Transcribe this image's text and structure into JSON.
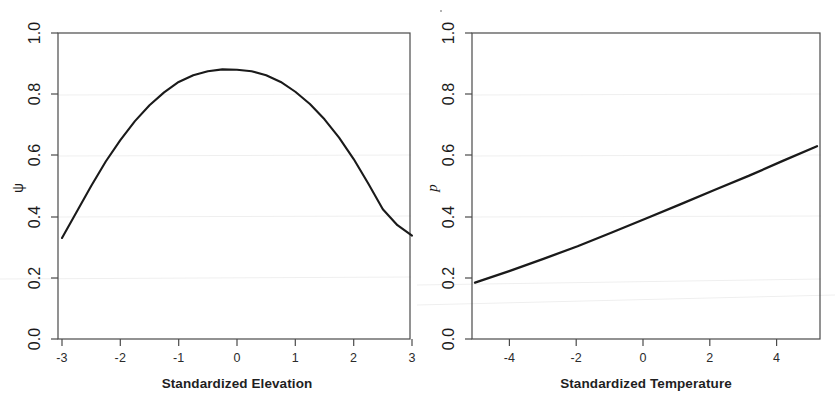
{
  "figure": {
    "background": "#ffffff",
    "line_color": "#1a1a1a",
    "axis_color": "#3a3a3a",
    "faint_grid_color": "#ececec",
    "speck_label": "scan-speck"
  },
  "chart_data": [
    {
      "id": "left",
      "type": "line",
      "title": "",
      "xlabel": "Standardized Elevation",
      "ylabel": "ψ",
      "xlim": [
        -3,
        3
      ],
      "ylim": [
        0,
        1
      ],
      "grid": false,
      "legend": null,
      "xticks": [
        "-3",
        "-2",
        "-1",
        "0",
        "1",
        "2",
        "3"
      ],
      "xtick_values": [
        -3,
        -2,
        -1,
        0,
        1,
        2,
        3
      ],
      "yticks": [
        "0.0",
        "0.2",
        "0.4",
        "0.6",
        "0.8",
        "1.0"
      ],
      "ytick_values": [
        0.0,
        0.2,
        0.4,
        0.6,
        0.8,
        1.0
      ],
      "x": [
        -3.0,
        -2.75,
        -2.5,
        -2.25,
        -2.0,
        -1.75,
        -1.5,
        -1.25,
        -1.0,
        -0.75,
        -0.5,
        -0.25,
        0.0,
        0.25,
        0.5,
        0.75,
        1.0,
        1.25,
        1.5,
        1.75,
        2.0,
        2.25,
        2.5,
        2.75,
        3.0
      ],
      "y": [
        0.33,
        0.415,
        0.5,
        0.58,
        0.65,
        0.712,
        0.764,
        0.806,
        0.84,
        0.862,
        0.875,
        0.881,
        0.88,
        0.875,
        0.862,
        0.84,
        0.808,
        0.768,
        0.718,
        0.658,
        0.588,
        0.508,
        0.424,
        0.372,
        0.338
      ]
    },
    {
      "id": "right",
      "type": "line",
      "title": "",
      "xlabel": "Standardized Temperature",
      "ylabel": "p",
      "xlim": [
        -5,
        5
      ],
      "ylim": [
        0,
        1
      ],
      "grid": false,
      "legend": null,
      "xticks": [
        "-4",
        "-2",
        "0",
        "2",
        "4"
      ],
      "xtick_values": [
        -4,
        -2,
        0,
        2,
        4
      ],
      "yticks": [
        "0.0",
        "0.2",
        "0.4",
        "0.6",
        "0.8",
        "1.0"
      ],
      "ytick_values": [
        0.0,
        0.2,
        0.4,
        0.6,
        0.8,
        1.0
      ],
      "x": [
        -5.0,
        -4.0,
        -3.0,
        -2.0,
        -1.0,
        0.0,
        1.0,
        2.0,
        3.0,
        4.0,
        5.0
      ],
      "y": [
        0.184,
        0.222,
        0.262,
        0.303,
        0.348,
        0.394,
        0.44,
        0.487,
        0.533,
        0.582,
        0.63
      ]
    }
  ]
}
